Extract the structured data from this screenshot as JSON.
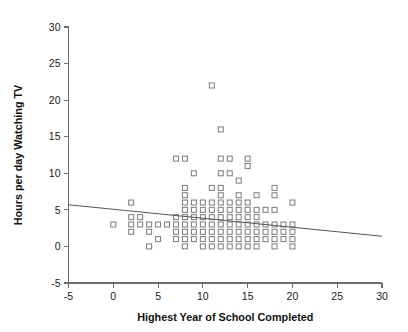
{
  "chart_data": {
    "type": "scatter",
    "title": "",
    "subtitle": "",
    "xlabel": "Highest Year of School Completed",
    "ylabel": "Hours per day Watching TV",
    "xlim": [
      -5,
      30
    ],
    "ylim": [
      -5,
      30
    ],
    "xticks": [
      -5,
      0,
      5,
      10,
      15,
      20,
      25,
      30
    ],
    "xtick_labels": [
      "-5",
      "0",
      "5",
      "10",
      "15",
      "20",
      "25",
      "30"
    ],
    "yticks": [
      -5,
      0,
      5,
      10,
      15,
      20,
      25,
      30
    ],
    "ytick_labels": [
      "-5",
      "0",
      "5",
      "10",
      "15",
      "20",
      "25",
      "30"
    ],
    "grid": false,
    "legend": null,
    "marker": "open-square",
    "marker_color": "#808080",
    "marker_size": 5,
    "trendline": {
      "type": "linear-regression",
      "color": "#555555",
      "x_start": -5,
      "y_start": 5.7,
      "x_end": 30,
      "y_end": 1.4,
      "slope": -0.1229,
      "intercept": 5.086
    },
    "points": [
      [
        0,
        3
      ],
      [
        2,
        6
      ],
      [
        2,
        4
      ],
      [
        2,
        3
      ],
      [
        2,
        2
      ],
      [
        3,
        4
      ],
      [
        3,
        3
      ],
      [
        4,
        3
      ],
      [
        4,
        2
      ],
      [
        4,
        0
      ],
      [
        5,
        3
      ],
      [
        5,
        1
      ],
      [
        6,
        3
      ],
      [
        7,
        12
      ],
      [
        7,
        4
      ],
      [
        7,
        3
      ],
      [
        7,
        2
      ],
      [
        7,
        1
      ],
      [
        8,
        12
      ],
      [
        8,
        8
      ],
      [
        8,
        7
      ],
      [
        8,
        6
      ],
      [
        8,
        5
      ],
      [
        8,
        4
      ],
      [
        8,
        3
      ],
      [
        8,
        2
      ],
      [
        8,
        1
      ],
      [
        8,
        0
      ],
      [
        9,
        10
      ],
      [
        9,
        6
      ],
      [
        9,
        5
      ],
      [
        9,
        4
      ],
      [
        9,
        3
      ],
      [
        9,
        2
      ],
      [
        9,
        1
      ],
      [
        10,
        6
      ],
      [
        10,
        5
      ],
      [
        10,
        4
      ],
      [
        10,
        3
      ],
      [
        10,
        2
      ],
      [
        10,
        1
      ],
      [
        10,
        0
      ],
      [
        11,
        22
      ],
      [
        11,
        8
      ],
      [
        11,
        6
      ],
      [
        11,
        5
      ],
      [
        11,
        4
      ],
      [
        11,
        3
      ],
      [
        11,
        2
      ],
      [
        11,
        1
      ],
      [
        11,
        0
      ],
      [
        12,
        16
      ],
      [
        12,
        12
      ],
      [
        12,
        10
      ],
      [
        12,
        8
      ],
      [
        12,
        7
      ],
      [
        12,
        6
      ],
      [
        12,
        5
      ],
      [
        12,
        4
      ],
      [
        12,
        3
      ],
      [
        12,
        2
      ],
      [
        12,
        1
      ],
      [
        12,
        0
      ],
      [
        13,
        12
      ],
      [
        13,
        10
      ],
      [
        13,
        6
      ],
      [
        13,
        5
      ],
      [
        13,
        4
      ],
      [
        13,
        3
      ],
      [
        13,
        2
      ],
      [
        13,
        1
      ],
      [
        13,
        0
      ],
      [
        14,
        9
      ],
      [
        14,
        7
      ],
      [
        14,
        6
      ],
      [
        14,
        5
      ],
      [
        14,
        4
      ],
      [
        14,
        3
      ],
      [
        14,
        2
      ],
      [
        14,
        1
      ],
      [
        14,
        0
      ],
      [
        15,
        12
      ],
      [
        15,
        11
      ],
      [
        15,
        6
      ],
      [
        15,
        5
      ],
      [
        15,
        4
      ],
      [
        15,
        3
      ],
      [
        15,
        2
      ],
      [
        15,
        1
      ],
      [
        15,
        0
      ],
      [
        16,
        7
      ],
      [
        16,
        5
      ],
      [
        16,
        4
      ],
      [
        16,
        3
      ],
      [
        16,
        2
      ],
      [
        16,
        1
      ],
      [
        16,
        0
      ],
      [
        17,
        5
      ],
      [
        17,
        3
      ],
      [
        17,
        2
      ],
      [
        17,
        1
      ],
      [
        18,
        8
      ],
      [
        18,
        7
      ],
      [
        18,
        5
      ],
      [
        18,
        3
      ],
      [
        18,
        2
      ],
      [
        18,
        1
      ],
      [
        18,
        0
      ],
      [
        19,
        3
      ],
      [
        19,
        2
      ],
      [
        19,
        1
      ],
      [
        20,
        6
      ],
      [
        20,
        3
      ],
      [
        20,
        2
      ],
      [
        20,
        1
      ],
      [
        20,
        0
      ]
    ]
  }
}
